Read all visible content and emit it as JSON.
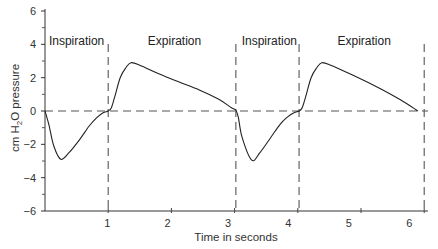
{
  "chart_data": {
    "type": "line",
    "title": "",
    "xlabel": "Time in seconds",
    "ylabel": "cm H2O pressure",
    "ylabel_parts": {
      "pre": "cm H",
      "sub": "2",
      "post": "O pressure"
    },
    "xlim": [
      0,
      6.3
    ],
    "ylim": [
      -6,
      6
    ],
    "x_ticks": [
      1,
      2,
      3,
      4,
      5,
      6
    ],
    "x_tick_labels": [
      "1",
      "2",
      "3",
      "4",
      "5",
      "6"
    ],
    "y_ticks": [
      6,
      4,
      2,
      0,
      -2,
      -4,
      -6
    ],
    "y_tick_labels": [
      "6",
      "4",
      "2",
      "0",
      "−2",
      "−4",
      "−6"
    ],
    "y_minor_ticks": [
      5,
      3,
      1,
      -1,
      -3,
      -5
    ],
    "grid": false,
    "legend": null,
    "reference_lines": {
      "horizontal_dashed_at": 0,
      "vertical_dashed_at": [
        1.0,
        3.02,
        4.02,
        6.0
      ]
    },
    "annotations": [
      {
        "text": "Inspiration",
        "x": 0.5,
        "y": 4.2
      },
      {
        "text": "Expiration",
        "x": 2.05,
        "y": 4.2
      },
      {
        "text": "Inspiration",
        "x": 3.55,
        "y": 4.2
      },
      {
        "text": "Expiration",
        "x": 5.05,
        "y": 4.2
      }
    ],
    "series": [
      {
        "name": "Intrapulmonary pressure",
        "x": [
          0,
          0.06,
          0.14,
          0.25,
          0.38,
          0.55,
          0.7,
          0.82,
          0.92,
          1.0,
          1.05,
          1.1,
          1.19,
          1.28,
          1.36,
          1.5,
          1.82,
          2.15,
          2.45,
          2.75,
          2.95,
          3.02,
          3.06,
          3.12,
          3.27,
          3.4,
          3.57,
          3.72,
          3.84,
          3.94,
          4.02,
          4.07,
          4.12,
          4.21,
          4.3,
          4.38,
          4.52,
          4.84,
          5.17,
          5.47,
          5.72,
          5.9
        ],
        "y": [
          0,
          -0.8,
          -2.1,
          -2.9,
          -2.5,
          -1.7,
          -0.9,
          -0.4,
          -0.1,
          0,
          0.2,
          0.8,
          2.0,
          2.6,
          2.9,
          2.75,
          2.2,
          1.7,
          1.25,
          0.7,
          0.2,
          0.05,
          -0.4,
          -1.6,
          -2.95,
          -2.5,
          -1.6,
          -0.8,
          -0.35,
          -0.1,
          0,
          0.2,
          0.8,
          2.0,
          2.6,
          2.9,
          2.75,
          2.2,
          1.6,
          1.0,
          0.45,
          0
        ]
      }
    ]
  }
}
